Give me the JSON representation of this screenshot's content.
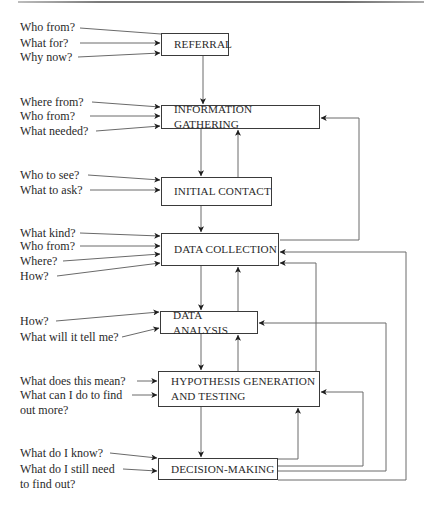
{
  "diagram": {
    "title": "",
    "stages": [
      {
        "id": "referral",
        "label": "REFERRAL",
        "questions": [
          "Who from?",
          "What for?",
          "Why now?"
        ]
      },
      {
        "id": "information-gathering",
        "label": "INFORMATION GATHERING",
        "questions": [
          "Where from?",
          "Who from?",
          "What needed?"
        ]
      },
      {
        "id": "initial-contact",
        "label": "INITIAL CONTACT",
        "questions": [
          "Who to see?",
          "What to ask?"
        ]
      },
      {
        "id": "data-collection",
        "label": "DATA COLLECTION",
        "questions": [
          "What kind?",
          "Who from?",
          "Where?",
          "How?"
        ]
      },
      {
        "id": "data-analysis",
        "label": "DATA ANALYSIS",
        "questions": [
          "How?",
          "What will it tell me?"
        ]
      },
      {
        "id": "hypothesis",
        "label": "HYPOTHESIS GENERATION\nAND TESTING",
        "questions": [
          "What does this mean?",
          "What can I do to find\nout more?"
        ]
      },
      {
        "id": "decision-making",
        "label": "DECISION-MAKING",
        "questions": [
          "What do I know?",
          "What do I still need\nto find out?"
        ]
      }
    ],
    "edges": [
      {
        "from": "referral",
        "to": "information-gathering"
      },
      {
        "from": "information-gathering",
        "to": "initial-contact"
      },
      {
        "from": "initial-contact",
        "to": "information-gathering"
      },
      {
        "from": "initial-contact",
        "to": "data-collection"
      },
      {
        "from": "data-collection",
        "to": "information-gathering"
      },
      {
        "from": "data-collection",
        "to": "data-analysis"
      },
      {
        "from": "data-analysis",
        "to": "data-collection"
      },
      {
        "from": "data-analysis",
        "to": "hypothesis"
      },
      {
        "from": "hypothesis",
        "to": "data-analysis"
      },
      {
        "from": "hypothesis",
        "to": "data-collection"
      },
      {
        "from": "hypothesis",
        "to": "decision-making"
      },
      {
        "from": "decision-making",
        "to": "hypothesis"
      },
      {
        "from": "decision-making",
        "to": "hypothesis"
      },
      {
        "from": "decision-making",
        "to": "data-analysis"
      },
      {
        "from": "decision-making",
        "to": "data-collection"
      }
    ],
    "colors": {
      "line": "#6a6a6a",
      "box_border": "#3a3a3a",
      "text": "#2a2a2a"
    }
  }
}
